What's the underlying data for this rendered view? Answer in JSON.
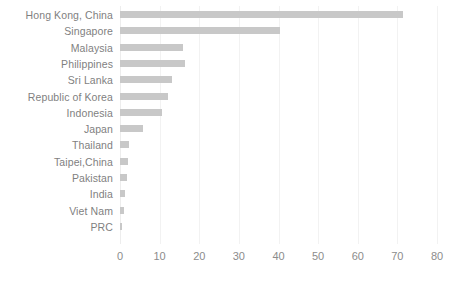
{
  "chart_data": {
    "type": "bar",
    "orientation": "horizontal",
    "title": "",
    "subtitle": "",
    "xlabel": "",
    "ylabel": "",
    "xlim": [
      0,
      80
    ],
    "xticks": [
      0,
      10,
      20,
      30,
      40,
      50,
      60,
      70,
      80
    ],
    "xtick_labels": [
      "0",
      "10",
      "20",
      "30",
      "40",
      "50",
      "60",
      "70",
      "80"
    ],
    "grid": true,
    "grid_axis": "x",
    "legend": false,
    "legend_position": "none",
    "bar_color": "#c8c8c8",
    "label_color": "#7f7f7f",
    "tick_color": "#8c8c8c",
    "gridline_color": "#f2f2f2",
    "background_color": "#ffffff",
    "categories": [
      "Hong Kong, China",
      "Singapore",
      "Malaysia",
      "Philippines",
      "Sri Lanka",
      "Republic of Korea",
      "Indonesia",
      "Japan",
      "Thailand",
      "Taipei,China",
      "Pakistan",
      "India",
      "Viet Nam",
      "PRC"
    ],
    "values": [
      71.5,
      40.3,
      16.0,
      16.3,
      13.0,
      12.2,
      10.5,
      5.8,
      2.2,
      1.9,
      1.8,
      1.3,
      1.0,
      0.5
    ]
  }
}
